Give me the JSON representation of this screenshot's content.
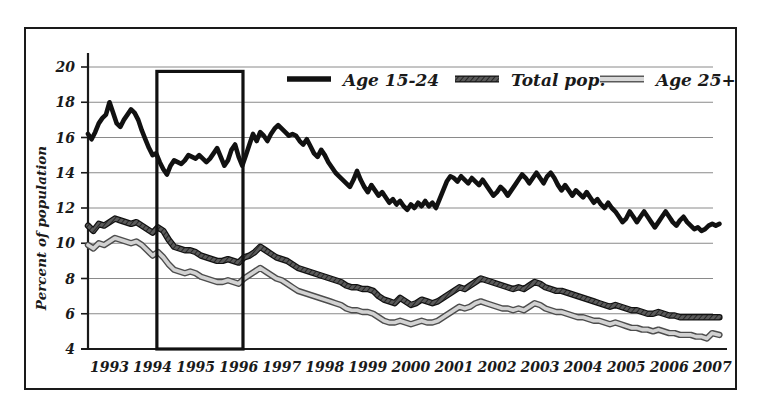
{
  "chart_data": {
    "type": "line",
    "title": "",
    "subtitle": "",
    "xlabel": "",
    "ylabel": "Percent of population",
    "ylim": [
      4,
      20
    ],
    "xlim": [
      1993.0,
      2007.75
    ],
    "y_ticks": [
      4,
      6,
      8,
      10,
      12,
      14,
      16,
      18,
      20
    ],
    "x_ticks": [
      1993,
      1994,
      1995,
      1996,
      1997,
      1998,
      1999,
      2000,
      2001,
      2002,
      2003,
      2004,
      2005,
      2006,
      2007
    ],
    "x_tick_labels": [
      "1993",
      "1994",
      "1995",
      "1996",
      "1997",
      "1998",
      "1999",
      "2000",
      "2001",
      "2002",
      "2003",
      "2004",
      "2005",
      "2006",
      "2007"
    ],
    "grid": "horizontal",
    "legend_position": "top-right-inside",
    "annotations": [
      {
        "name": "highlight-rectangle",
        "type": "rect",
        "x_start": 1994.6,
        "x_end": 1996.6,
        "y_start": 4,
        "y_end": 19.75,
        "description": "Black outlined rectangle highlighting mid-1994 through mid-1996"
      }
    ],
    "series": [
      {
        "name": "Age 15-24",
        "style": "solid-black-thick",
        "color": "#111111",
        "x": [
          1993.0,
          1993.083,
          1993.167,
          1993.25,
          1993.333,
          1993.417,
          1993.5,
          1993.583,
          1993.667,
          1993.75,
          1993.833,
          1993.917,
          1994.0,
          1994.083,
          1994.167,
          1994.25,
          1994.333,
          1994.417,
          1994.5,
          1994.583,
          1994.667,
          1994.75,
          1994.833,
          1994.917,
          1995.0,
          1995.083,
          1995.167,
          1995.25,
          1995.333,
          1995.417,
          1995.5,
          1995.583,
          1995.667,
          1995.75,
          1995.833,
          1995.917,
          1996.0,
          1996.083,
          1996.167,
          1996.25,
          1996.333,
          1996.417,
          1996.5,
          1996.583,
          1996.667,
          1996.75,
          1996.833,
          1996.917,
          1997.0,
          1997.083,
          1997.167,
          1997.25,
          1997.333,
          1997.417,
          1997.5,
          1997.583,
          1997.667,
          1997.75,
          1997.833,
          1997.917,
          1998.0,
          1998.083,
          1998.167,
          1998.25,
          1998.333,
          1998.417,
          1998.5,
          1998.583,
          1998.667,
          1998.75,
          1998.833,
          1998.917,
          1999.0,
          1999.083,
          1999.167,
          1999.25,
          1999.333,
          1999.417,
          1999.5,
          1999.583,
          1999.667,
          1999.75,
          1999.833,
          1999.917,
          2000.0,
          2000.083,
          2000.167,
          2000.25,
          2000.333,
          2000.417,
          2000.5,
          2000.583,
          2000.667,
          2000.75,
          2000.833,
          2000.917,
          2001.0,
          2001.083,
          2001.167,
          2001.25,
          2001.333,
          2001.417,
          2001.5,
          2001.583,
          2001.667,
          2001.75,
          2001.833,
          2001.917,
          2002.0,
          2002.083,
          2002.167,
          2002.25,
          2002.333,
          2002.417,
          2002.5,
          2002.583,
          2002.667,
          2002.75,
          2002.833,
          2002.917,
          2003.0,
          2003.083,
          2003.167,
          2003.25,
          2003.333,
          2003.417,
          2003.5,
          2003.583,
          2003.667,
          2003.75,
          2003.833,
          2003.917,
          2004.0,
          2004.083,
          2004.167,
          2004.25,
          2004.333,
          2004.417,
          2004.5,
          2004.583,
          2004.667,
          2004.75,
          2004.833,
          2004.917,
          2005.0,
          2005.083,
          2005.167,
          2005.25,
          2005.333,
          2005.417,
          2005.5,
          2005.583,
          2005.667,
          2005.75,
          2005.833,
          2005.917,
          2006.0,
          2006.083,
          2006.167,
          2006.25,
          2006.333,
          2006.417,
          2006.5,
          2006.583,
          2006.667,
          2006.75,
          2006.833,
          2006.917,
          2007.0,
          2007.083,
          2007.167,
          2007.25,
          2007.333,
          2007.417,
          2007.5,
          2007.583,
          2007.667
        ],
        "values": [
          16.2,
          15.9,
          16.3,
          16.8,
          17.1,
          17.3,
          18.0,
          17.4,
          16.8,
          16.6,
          17.0,
          17.3,
          17.6,
          17.4,
          17.0,
          16.4,
          15.9,
          15.4,
          15.0,
          15.1,
          14.6,
          14.2,
          13.9,
          14.4,
          14.7,
          14.6,
          14.5,
          14.7,
          15.0,
          14.9,
          14.8,
          15.0,
          14.8,
          14.6,
          14.8,
          15.1,
          15.4,
          14.9,
          14.4,
          14.7,
          15.3,
          15.6,
          14.9,
          14.4,
          15.0,
          15.6,
          16.2,
          15.8,
          16.3,
          16.1,
          15.8,
          16.2,
          16.5,
          16.7,
          16.5,
          16.3,
          16.1,
          16.2,
          16.1,
          15.8,
          15.6,
          15.9,
          15.5,
          15.1,
          14.9,
          15.3,
          15.0,
          14.6,
          14.3,
          14.0,
          13.8,
          13.6,
          13.4,
          13.2,
          13.6,
          14.1,
          13.6,
          13.2,
          12.9,
          13.3,
          13.0,
          12.7,
          12.9,
          12.6,
          12.3,
          12.5,
          12.2,
          12.4,
          12.1,
          11.9,
          12.2,
          12.0,
          12.3,
          12.1,
          12.4,
          12.1,
          12.3,
          12.0,
          12.5,
          13.0,
          13.5,
          13.8,
          13.7,
          13.5,
          13.8,
          13.6,
          13.4,
          13.7,
          13.5,
          13.3,
          13.6,
          13.3,
          13.0,
          12.7,
          12.9,
          13.2,
          13.0,
          12.7,
          13.0,
          13.3,
          13.6,
          13.9,
          13.7,
          13.4,
          13.7,
          14.0,
          13.7,
          13.4,
          13.8,
          14.0,
          13.7,
          13.3,
          13.0,
          13.3,
          13.0,
          12.7,
          13.0,
          12.8,
          12.6,
          12.9,
          12.6,
          12.3,
          12.5,
          12.2,
          12.0,
          12.3,
          12.0,
          11.8,
          11.5,
          11.2,
          11.4,
          11.8,
          11.5,
          11.2,
          11.5,
          11.8,
          11.5,
          11.2,
          10.9,
          11.2,
          11.5,
          11.8,
          11.5,
          11.2,
          11.0,
          11.3,
          11.5,
          11.2,
          11.0,
          10.8,
          10.9,
          10.7,
          10.8,
          11.0,
          11.1,
          11.0,
          11.1
        ]
      },
      {
        "name": "Total pop.",
        "style": "dark-gray-hatched",
        "color": "#4a4a4a",
        "x": [
          1993.0,
          1993.125,
          1993.25,
          1993.375,
          1993.5,
          1993.625,
          1993.75,
          1993.875,
          1994.0,
          1994.125,
          1994.25,
          1994.375,
          1994.5,
          1994.625,
          1994.75,
          1994.875,
          1995.0,
          1995.125,
          1995.25,
          1995.375,
          1995.5,
          1995.625,
          1995.75,
          1995.875,
          1996.0,
          1996.125,
          1996.25,
          1996.375,
          1996.5,
          1996.625,
          1996.75,
          1996.875,
          1997.0,
          1997.125,
          1997.25,
          1997.375,
          1997.5,
          1997.625,
          1997.75,
          1997.875,
          1998.0,
          1998.125,
          1998.25,
          1998.375,
          1998.5,
          1998.625,
          1998.75,
          1998.875,
          1999.0,
          1999.125,
          1999.25,
          1999.375,
          1999.5,
          1999.625,
          1999.75,
          1999.875,
          2000.0,
          2000.125,
          2000.25,
          2000.375,
          2000.5,
          2000.625,
          2000.75,
          2000.875,
          2001.0,
          2001.125,
          2001.25,
          2001.375,
          2001.5,
          2001.625,
          2001.75,
          2001.875,
          2002.0,
          2002.125,
          2002.25,
          2002.375,
          2002.5,
          2002.625,
          2002.75,
          2002.875,
          2003.0,
          2003.125,
          2003.25,
          2003.375,
          2003.5,
          2003.625,
          2003.75,
          2003.875,
          2004.0,
          2004.125,
          2004.25,
          2004.375,
          2004.5,
          2004.625,
          2004.75,
          2004.875,
          2005.0,
          2005.125,
          2005.25,
          2005.375,
          2005.5,
          2005.625,
          2005.75,
          2005.875,
          2006.0,
          2006.125,
          2006.25,
          2006.375,
          2006.5,
          2006.625,
          2006.75,
          2006.875,
          2007.0,
          2007.125,
          2007.25,
          2007.375,
          2007.5,
          2007.667
        ],
        "values": [
          11.0,
          10.7,
          11.1,
          11.0,
          11.2,
          11.4,
          11.3,
          11.2,
          11.1,
          11.2,
          11.0,
          10.8,
          10.6,
          10.9,
          10.7,
          10.2,
          9.8,
          9.7,
          9.6,
          9.6,
          9.5,
          9.3,
          9.2,
          9.1,
          9.0,
          9.0,
          9.1,
          9.0,
          8.9,
          9.2,
          9.3,
          9.5,
          9.8,
          9.6,
          9.4,
          9.2,
          9.1,
          9.0,
          8.8,
          8.6,
          8.5,
          8.4,
          8.3,
          8.2,
          8.1,
          8.0,
          7.9,
          7.8,
          7.6,
          7.5,
          7.5,
          7.4,
          7.4,
          7.3,
          7.0,
          6.8,
          6.7,
          6.6,
          6.9,
          6.7,
          6.5,
          6.6,
          6.8,
          6.7,
          6.6,
          6.7,
          6.9,
          7.1,
          7.3,
          7.5,
          7.4,
          7.6,
          7.8,
          8.0,
          7.9,
          7.8,
          7.7,
          7.6,
          7.5,
          7.4,
          7.5,
          7.4,
          7.6,
          7.8,
          7.7,
          7.5,
          7.4,
          7.3,
          7.3,
          7.2,
          7.1,
          7.0,
          6.9,
          6.8,
          6.7,
          6.6,
          6.5,
          6.4,
          6.5,
          6.4,
          6.3,
          6.2,
          6.2,
          6.1,
          6.0,
          6.0,
          6.1,
          6.0,
          5.9,
          5.9,
          5.8,
          5.8,
          5.8,
          5.8,
          5.8,
          5.8,
          5.8,
          5.8
        ]
      },
      {
        "name": "Age 25+",
        "style": "light-gray",
        "color": "#9a9a9a",
        "x": [
          1993.0,
          1993.125,
          1993.25,
          1993.375,
          1993.5,
          1993.625,
          1993.75,
          1993.875,
          1994.0,
          1994.125,
          1994.25,
          1994.375,
          1994.5,
          1994.625,
          1994.75,
          1994.875,
          1995.0,
          1995.125,
          1995.25,
          1995.375,
          1995.5,
          1995.625,
          1995.75,
          1995.875,
          1996.0,
          1996.125,
          1996.25,
          1996.375,
          1996.5,
          1996.625,
          1996.75,
          1996.875,
          1997.0,
          1997.125,
          1997.25,
          1997.375,
          1997.5,
          1997.625,
          1997.75,
          1997.875,
          1998.0,
          1998.125,
          1998.25,
          1998.375,
          1998.5,
          1998.625,
          1998.75,
          1998.875,
          1999.0,
          1999.125,
          1999.25,
          1999.375,
          1999.5,
          1999.625,
          1999.75,
          1999.875,
          2000.0,
          2000.125,
          2000.25,
          2000.375,
          2000.5,
          2000.625,
          2000.75,
          2000.875,
          2001.0,
          2001.125,
          2001.25,
          2001.375,
          2001.5,
          2001.625,
          2001.75,
          2001.875,
          2002.0,
          2002.125,
          2002.25,
          2002.375,
          2002.5,
          2002.625,
          2002.75,
          2002.875,
          2003.0,
          2003.125,
          2003.25,
          2003.375,
          2003.5,
          2003.625,
          2003.75,
          2003.875,
          2004.0,
          2004.125,
          2004.25,
          2004.375,
          2004.5,
          2004.625,
          2004.75,
          2004.875,
          2005.0,
          2005.125,
          2005.25,
          2005.375,
          2005.5,
          2005.625,
          2005.75,
          2005.875,
          2006.0,
          2006.125,
          2006.25,
          2006.375,
          2006.5,
          2006.625,
          2006.75,
          2006.875,
          2007.0,
          2007.125,
          2007.25,
          2007.375,
          2007.5,
          2007.667
        ],
        "values": [
          9.9,
          9.7,
          10.0,
          9.9,
          10.1,
          10.3,
          10.2,
          10.1,
          10.0,
          10.1,
          9.9,
          9.6,
          9.3,
          9.5,
          9.2,
          8.8,
          8.5,
          8.4,
          8.3,
          8.4,
          8.3,
          8.1,
          8.0,
          7.9,
          7.8,
          7.8,
          7.9,
          7.8,
          7.7,
          8.0,
          8.2,
          8.4,
          8.6,
          8.4,
          8.2,
          8.0,
          7.9,
          7.7,
          7.5,
          7.3,
          7.2,
          7.1,
          7.0,
          6.9,
          6.8,
          6.7,
          6.6,
          6.5,
          6.3,
          6.2,
          6.2,
          6.1,
          6.1,
          6.0,
          5.8,
          5.6,
          5.5,
          5.5,
          5.6,
          5.5,
          5.4,
          5.5,
          5.6,
          5.5,
          5.5,
          5.6,
          5.8,
          6.0,
          6.2,
          6.4,
          6.3,
          6.4,
          6.6,
          6.7,
          6.6,
          6.5,
          6.4,
          6.3,
          6.3,
          6.2,
          6.3,
          6.2,
          6.4,
          6.6,
          6.5,
          6.3,
          6.2,
          6.1,
          6.1,
          6.0,
          5.9,
          5.8,
          5.8,
          5.7,
          5.6,
          5.6,
          5.5,
          5.4,
          5.5,
          5.4,
          5.3,
          5.2,
          5.2,
          5.1,
          5.1,
          5.0,
          5.1,
          5.0,
          4.9,
          4.9,
          4.8,
          4.8,
          4.8,
          4.7,
          4.7,
          4.6,
          4.9,
          4.8
        ]
      }
    ]
  },
  "legend": {
    "items": [
      {
        "label": "Age 15-24",
        "swatch": "solid-black-line-swatch"
      },
      {
        "label": "Total pop.",
        "swatch": "dark-hatched-line-swatch"
      },
      {
        "label": "Age 25+",
        "swatch": "light-gray-line-swatch"
      }
    ]
  },
  "axes": {
    "y_title": "Percent of population"
  }
}
